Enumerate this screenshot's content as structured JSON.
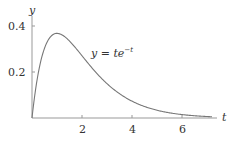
{
  "chart_data": {
    "type": "line",
    "title": "",
    "xlabel": "t",
    "ylabel": "y",
    "xlim": [
      0,
      7.4
    ],
    "ylim": [
      0,
      0.42
    ],
    "grid": false,
    "legend": null,
    "x_ticks": [
      2,
      4,
      6
    ],
    "x_tick_labels": [
      "2",
      "4",
      "6"
    ],
    "y_ticks": [
      0.2,
      0.4
    ],
    "y_tick_labels": [
      "0.2",
      "0.4"
    ],
    "series": [
      {
        "name": "y = te^{-t}",
        "function": "t*exp(-t)",
        "t_range": [
          0,
          7.2
        ],
        "x": [
          0,
          0.25,
          0.5,
          1,
          1.5,
          2,
          2.5,
          3,
          4,
          5,
          6,
          7
        ],
        "values": [
          0,
          0.195,
          0.303,
          0.368,
          0.335,
          0.271,
          0.205,
          0.149,
          0.073,
          0.034,
          0.015,
          0.006
        ]
      }
    ],
    "annotations": [
      {
        "text_base": "y = te",
        "text_sup": "−t",
        "x": 3.3,
        "y": 0.31
      }
    ]
  },
  "labels": {
    "y_axis": "y",
    "x_axis": "t",
    "y_tick_04": "0.4",
    "y_tick_02": "0.2",
    "x_tick_2": "2",
    "x_tick_4": "4",
    "x_tick_6": "6",
    "curve_label_base": "y = te",
    "curve_label_sup": "−t"
  },
  "colors": {
    "axis": "#999999",
    "curve": "#777777",
    "text": "#333333"
  }
}
